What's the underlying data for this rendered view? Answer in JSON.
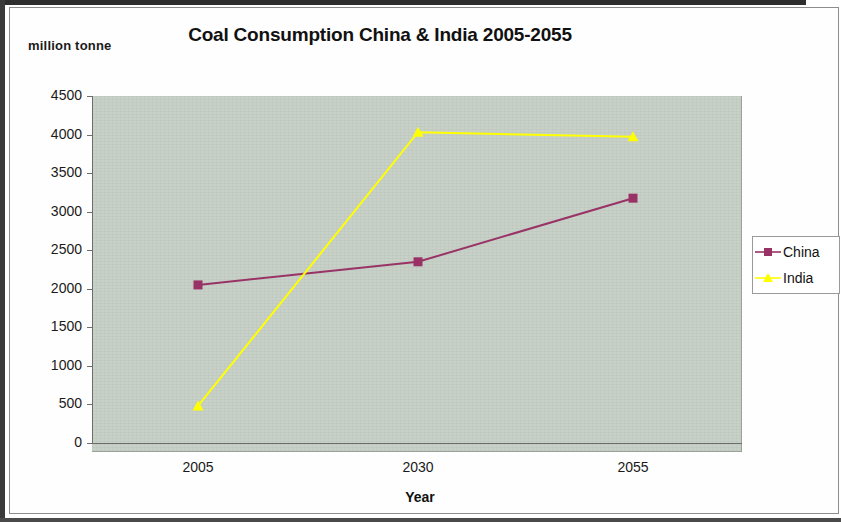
{
  "units_label": "million tonne",
  "legend": {
    "items": [
      {
        "name": "China",
        "color": "#993366",
        "marker": "square"
      },
      {
        "name": "India",
        "color": "#FFFF00",
        "marker": "triangle"
      }
    ]
  },
  "chart_data": {
    "type": "line",
    "title": "Coal Consumption China & India 2005-2055",
    "xlabel": "Year",
    "ylabel": "million tonne",
    "categories": [
      "2005",
      "2030",
      "2055"
    ],
    "series": [
      {
        "name": "China",
        "color": "#993366",
        "marker": "square",
        "values": [
          2050,
          2350,
          3175
        ]
      },
      {
        "name": "India",
        "color": "#FFFF00",
        "marker": "triangle",
        "values": [
          480,
          4030,
          3970
        ]
      }
    ],
    "ylim": [
      0,
      4500
    ],
    "y_ticks": [
      "0",
      "500",
      "1000",
      "1500",
      "2000",
      "2500",
      "3000",
      "3500",
      "4000",
      "4500"
    ],
    "y_tick_values": [
      0,
      500,
      1000,
      1500,
      2000,
      2500,
      3000,
      3500,
      4000,
      4500
    ],
    "x_ticks": [
      "2005",
      "2030",
      "2055"
    ],
    "grid": false,
    "legend_position": "right",
    "plot_background": "#c8d1c8"
  }
}
